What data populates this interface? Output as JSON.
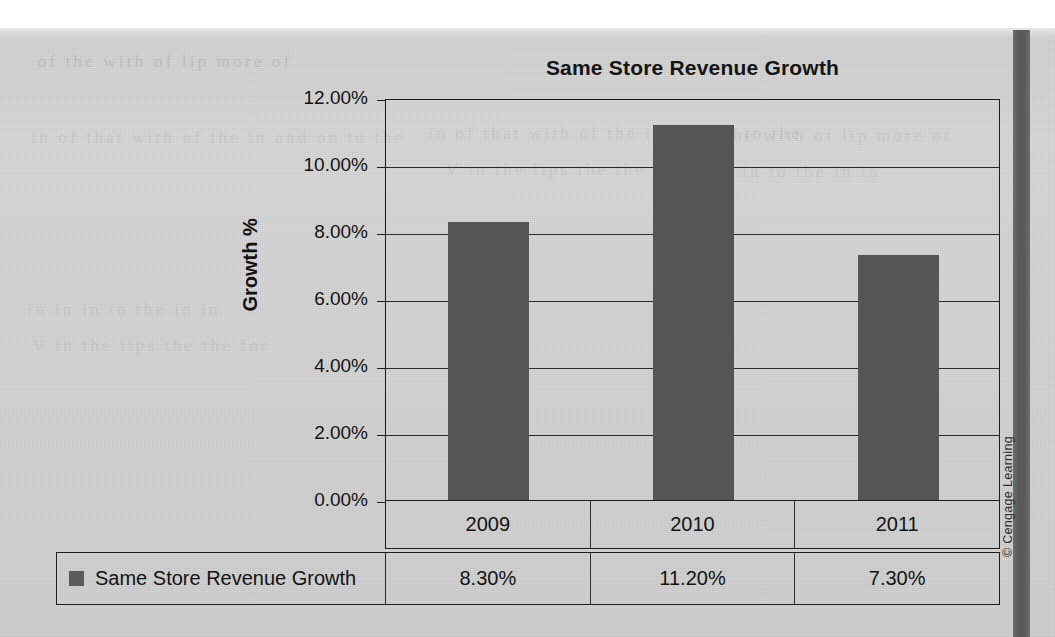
{
  "chart_data": {
    "type": "bar",
    "title": "Same Store Revenue Growth",
    "xlabel": "",
    "ylabel": "Growth %",
    "categories": [
      "2009",
      "2010",
      "2011"
    ],
    "series": [
      {
        "name": "Same Store Revenue Growth",
        "values": [
          8.3,
          11.2,
          7.3
        ],
        "value_labels": [
          "8.30%",
          "11.20%",
          "7.30%"
        ],
        "color": "#555555"
      }
    ],
    "ylim": [
      0,
      12
    ],
    "ytick_values": [
      12,
      10,
      8,
      6,
      4,
      2,
      0
    ],
    "ytick_labels": [
      "12.00%",
      "10.00%",
      "8.00%",
      "6.00%",
      "4.00%",
      "2.00%",
      "0.00%"
    ],
    "grid": true,
    "legend_position": "bottom-table",
    "data_table": {
      "header_row": [
        "2009",
        "2010",
        "2011"
      ],
      "rows": [
        {
          "label": "Same Store Revenue Growth",
          "cells": [
            "8.30%",
            "11.20%",
            "7.30%"
          ]
        }
      ]
    }
  },
  "page": {
    "copyright": "© Cengage Learning",
    "ghost_text": [
      "of the with of lip more of",
      "in of that with of the in and on to the",
      "in in in to the in in",
      "V in the lips the the for"
    ]
  },
  "colors": {
    "bar": "#555555",
    "axis": "#1d1d1d",
    "grid": "#2a2a2a",
    "page": "#d6d6d6",
    "spine": "#5b5b5b",
    "text": "#131313"
  }
}
